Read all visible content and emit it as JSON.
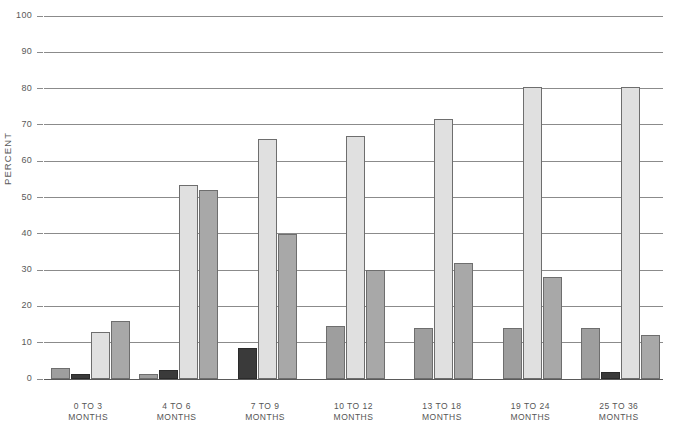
{
  "chart_data": {
    "type": "bar",
    "title": "",
    "xlabel": "",
    "ylabel": "PERCENT",
    "ylim": [
      0,
      100
    ],
    "yticks": [
      0,
      10,
      20,
      30,
      40,
      50,
      60,
      70,
      80,
      90,
      100
    ],
    "grid": true,
    "legend": "none",
    "categories": [
      "0 TO 3\nMONTHS",
      "4 TO 6\nMONTHS",
      "7 TO 9\nMONTHS",
      "10 TO 12\nMONTHS",
      "13 TO 18\nMONTHS",
      "19 TO 24\nMONTHS",
      "25 TO 36\nMONTHS"
    ],
    "groups": [
      {
        "label": "0 TO 3\nMONTHS",
        "bars": [
          {
            "value": 3.0,
            "shade": "s1"
          },
          {
            "value": 1.5,
            "shade": "s2"
          },
          {
            "value": 13.0,
            "shade": "s3"
          },
          {
            "value": 16.0,
            "shade": "s4"
          }
        ]
      },
      {
        "label": "4 TO 6\nMONTHS",
        "bars": [
          {
            "value": 1.5,
            "shade": "s1"
          },
          {
            "value": 2.5,
            "shade": "s2"
          },
          {
            "value": 53.5,
            "shade": "s3"
          },
          {
            "value": 52.0,
            "shade": "s4"
          }
        ]
      },
      {
        "label": "7 TO 9\nMONTHS",
        "bars": [
          {
            "value": 8.5,
            "shade": "s2"
          },
          {
            "value": 66.0,
            "shade": "s3"
          },
          {
            "value": 40.0,
            "shade": "s4"
          }
        ]
      },
      {
        "label": "10 TO 12\nMONTHS",
        "bars": [
          {
            "value": 14.5,
            "shade": "s1"
          },
          {
            "value": 67.0,
            "shade": "s3"
          },
          {
            "value": 30.0,
            "shade": "s4"
          }
        ]
      },
      {
        "label": "13 TO 18\nMONTHS",
        "bars": [
          {
            "value": 14.0,
            "shade": "s1"
          },
          {
            "value": 71.5,
            "shade": "s3"
          },
          {
            "value": 32.0,
            "shade": "s4"
          }
        ]
      },
      {
        "label": "19 TO 24\nMONTHS",
        "bars": [
          {
            "value": 14.0,
            "shade": "s1"
          },
          {
            "value": 80.5,
            "shade": "s3"
          },
          {
            "value": 28.0,
            "shade": "s4"
          }
        ]
      },
      {
        "label": "25 TO 36\nMONTHS",
        "bars": [
          {
            "value": 14.0,
            "shade": "s1"
          },
          {
            "value": 2.0,
            "shade": "s2"
          },
          {
            "value": 80.5,
            "shade": "s3"
          },
          {
            "value": 12.0,
            "shade": "s4"
          }
        ]
      }
    ]
  },
  "axis": {
    "y_title": "PERCENT",
    "y_tick_labels": [
      "0",
      "10",
      "20",
      "30",
      "40",
      "50",
      "60",
      "70",
      "80",
      "90",
      "100"
    ]
  },
  "colors": {
    "grid": "#8b8b8b",
    "bar_light": "#e0e0e0",
    "bar_medium": "#a8a8a8",
    "bar_dark": "#3a3a3a",
    "bar_outline": "#6e6e6e",
    "text": "#595959",
    "background": "#ffffff"
  }
}
